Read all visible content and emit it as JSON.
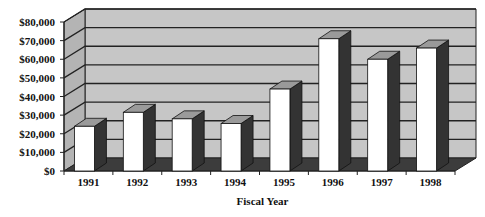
{
  "chart_data": {
    "type": "bar",
    "style": "3d-column",
    "title": "",
    "xlabel": "Fiscal Year",
    "ylabel": "",
    "categories": [
      "1991",
      "1992",
      "1993",
      "1994",
      "1995",
      "1996",
      "1997",
      "1998"
    ],
    "values": [
      24000,
      31500,
      28000,
      25500,
      44000,
      71000,
      60000,
      66000
    ],
    "ylim": [
      0,
      80000
    ],
    "yticks": [
      0,
      10000,
      20000,
      30000,
      40000,
      50000,
      60000,
      70000,
      80000
    ],
    "ytick_labels": [
      "$0",
      "$10,000",
      "$20,000",
      "$30,000",
      "$40,000",
      "$50,000",
      "$60,000",
      "$70,000",
      "$80,000"
    ],
    "grid": true,
    "legend": null
  },
  "colors": {
    "wall": "#c6c6c6",
    "side_wall": "#b4b4b4",
    "floor": "#3c3c3c",
    "bar_front": "#ffffff",
    "bar_side": "#333333",
    "bar_top": "#9a9a9a",
    "grid": "#222222"
  }
}
